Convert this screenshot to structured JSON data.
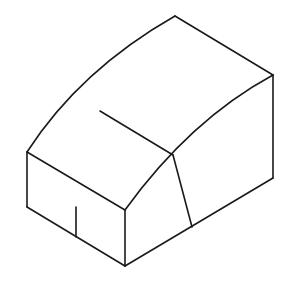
{
  "figure": {
    "background": "#ffffff",
    "stroke_color": "#1a1a1a",
    "stroke_width": 1.6,
    "vertices": {
      "top": [
        175,
        16
      ],
      "right_top": [
        273,
        75
      ],
      "right_bottom": [
        273,
        178
      ],
      "left_top": [
        27,
        152
      ],
      "left_bottom": [
        27,
        207
      ],
      "front_top": [
        125,
        210
      ],
      "front_bottom": [
        125,
        266
      ],
      "mid_ridge": [
        173,
        155
      ],
      "inner_line_start": [
        100,
        111
      ],
      "crease_bottom": [
        192,
        227
      ],
      "tick_top": [
        76,
        207
      ],
      "tick_bottom": [
        76,
        237
      ]
    },
    "edges": [
      {
        "name": "top-left-curved-edge",
        "d": "M27,152 Q80,70 175,16"
      },
      {
        "name": "top-right-edge",
        "d": "M175,16 L273,75"
      },
      {
        "name": "right-vertical-edge",
        "d": "M273,75 L273,178"
      },
      {
        "name": "front-curved-edge",
        "d": "M125,210 Q190,120 273,75"
      },
      {
        "name": "left-top-edge",
        "d": "M27,152 L125,210"
      },
      {
        "name": "left-vertical-edge",
        "d": "M27,152 L27,207"
      },
      {
        "name": "left-bottom-edge",
        "d": "M27,207 L125,266"
      },
      {
        "name": "front-vertical-edge",
        "d": "M125,210 L125,266"
      },
      {
        "name": "bottom-right-edge",
        "d": "M125,266 L273,178"
      },
      {
        "name": "inner-top-line",
        "d": "M100,111 L173,155"
      },
      {
        "name": "crease-line",
        "d": "M173,155 L192,227"
      },
      {
        "name": "left-face-tick",
        "d": "M76,207 L76,237"
      }
    ]
  }
}
